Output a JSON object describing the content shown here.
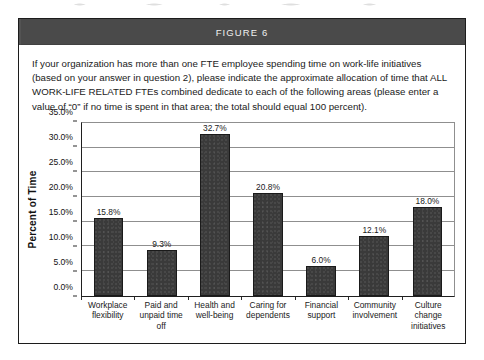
{
  "figure": {
    "header_label": "FIGURE 6",
    "intro_text": "If your organization has more than one FTE employee spending time on work-life initiatives (based on your answer in question 2), please indicate the approximate allocation of time that ALL WORK-LIFE RELATED FTEs combined dedicate to each of the following areas (please enter a value of “0” if no time is spent in that area; the total should equal 100 percent)."
  },
  "colors": {
    "header_bar": "#4a4a4a",
    "bar_fill": "#3a3a3a",
    "bar_border": "#1a1a1a",
    "gridline": "#8f8f8f",
    "axis": "#1f1f1f",
    "panel_border": "#1c1c1c",
    "header_text": "#f0f0f0"
  },
  "chart_data": {
    "type": "bar",
    "title": "",
    "xlabel": "",
    "ylabel": "Percent of Time",
    "ylim": [
      0,
      35
    ],
    "ytick_values": [
      0,
      5,
      10,
      15,
      20,
      25,
      30,
      35
    ],
    "ytick_labels": [
      "0.0%",
      "5.0%",
      "10.0%",
      "15.0%",
      "20.0%",
      "25.0%",
      "30.0%",
      "35.0%"
    ],
    "grid": true,
    "legend": "none",
    "categories": [
      "Workplace flexibility",
      "Paid and unpaid time off",
      "Health and well-being",
      "Caring for dependents",
      "Financial support",
      "Community involvement",
      "Culture change initiatives"
    ],
    "values": [
      15.8,
      9.3,
      32.7,
      20.8,
      6.0,
      12.1,
      18.0
    ],
    "value_labels": [
      "15.8%",
      "9.3%",
      "32.7%",
      "20.8%",
      "6.0%",
      "12.1%",
      "18.0%"
    ]
  }
}
